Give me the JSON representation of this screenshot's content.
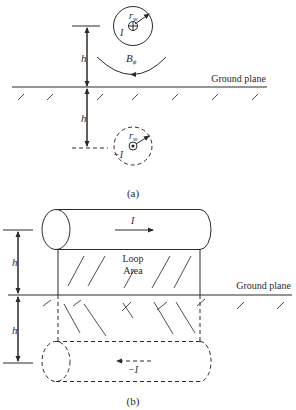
{
  "figure_a": {
    "caption": "(a)",
    "wire_current_label": "I",
    "image_current_label": "−I",
    "radius_label": "r",
    "radius_subscript": "w",
    "field_label": "B",
    "field_subscript": "ϕ",
    "height_label_upper": "h",
    "height_label_lower": "h",
    "ground_plane_label": "Ground plane"
  },
  "figure_b": {
    "caption": "(b)",
    "wire_current_label": "I",
    "image_current_label": "−I",
    "loop_area_line1": "Loop",
    "loop_area_line2": "Area",
    "height_label_upper": "h",
    "height_label_lower": "h",
    "ground_plane_label": "Ground plane"
  },
  "colors": {
    "ink": "#2a2a2a",
    "background": "#ffffff"
  }
}
